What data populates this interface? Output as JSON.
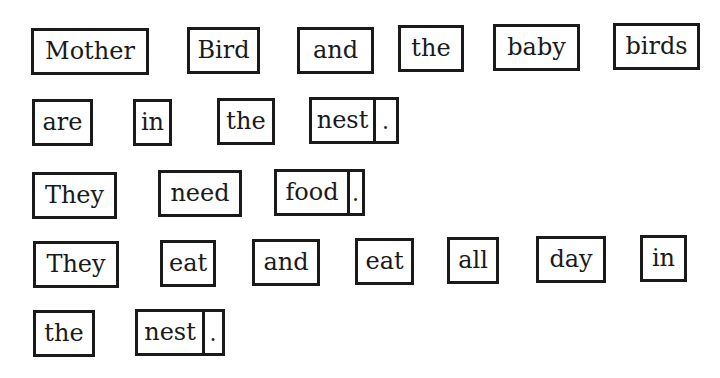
{
  "lines": [
    {
      "words": [
        "Mother",
        "Bird",
        "and",
        "the",
        "baby",
        "birds"
      ],
      "period": false
    },
    {
      "words": [
        "are",
        "in",
        "the",
        "nest"
      ],
      "period": true
    },
    {
      "words": [
        "They",
        "need",
        "food"
      ],
      "period": true
    },
    {
      "words": [
        "They",
        "eat",
        "and",
        "eat",
        "all",
        "day",
        "in"
      ],
      "period": false
    },
    {
      "words": [
        "the",
        "nest"
      ],
      "period": true
    }
  ],
  "punctuation": {
    "period": "."
  }
}
